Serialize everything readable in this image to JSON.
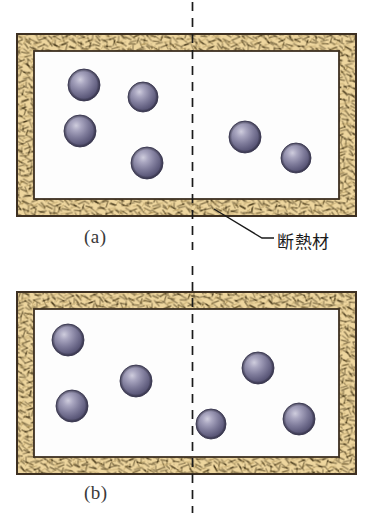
{
  "figure": {
    "background_color": "#ffffff",
    "captions": [
      {
        "id": "a",
        "text": "(a)",
        "x": 84,
        "y": 226
      },
      {
        "id": "b",
        "text": "(b)",
        "x": 84,
        "y": 482
      }
    ],
    "annotations": [
      {
        "name": "insulation-label",
        "text": "断熱材",
        "x": 277,
        "y": 228,
        "leader_line": {
          "x1": 214,
          "y1": 210,
          "x2": 268,
          "y2": 238
        }
      }
    ],
    "colors": {
      "insulation_fill": "#ecd49a",
      "insulation_fiber": "#4a3b1e",
      "insulation_fiber_light": "#b49a5c",
      "outline": "#3d3022",
      "interior_fill": "#fdfdfd",
      "sphere_core": "#6b6784",
      "sphere_highlight": "#b9b7cb",
      "sphere_edge": "#45435c",
      "sphere_outline": "#3b3950",
      "center_line": "#1a1a1a",
      "caption_text": "#3a3a3a",
      "annotation_text": "#1a1a1a"
    },
    "center_line": {
      "name": "symmetry-axis",
      "x": 192.5,
      "dash": "9,7",
      "segments": [
        {
          "y1": 2,
          "y2": 250
        },
        {
          "y1": 266,
          "y2": 513
        }
      ]
    },
    "panels": [
      {
        "id": "a",
        "name": "panel-a",
        "outer": {
          "x": 17,
          "y": 34,
          "w": 339,
          "h": 182
        },
        "insulation_thickness": 17,
        "inner": {
          "x": 34,
          "y": 51,
          "w": 305,
          "h": 148
        },
        "particles": [
          {
            "cx": 84,
            "cy": 85,
            "r": 16
          },
          {
            "cx": 143,
            "cy": 97,
            "r": 15
          },
          {
            "cx": 80,
            "cy": 131,
            "r": 16
          },
          {
            "cx": 147,
            "cy": 163,
            "r": 16
          },
          {
            "cx": 245,
            "cy": 137,
            "r": 16
          },
          {
            "cx": 296,
            "cy": 158,
            "r": 15
          }
        ],
        "particle_count_left": 4,
        "particle_count_right": 2
      },
      {
        "id": "b",
        "name": "panel-b",
        "outer": {
          "x": 17,
          "y": 292,
          "w": 339,
          "h": 182
        },
        "insulation_thickness": 17,
        "inner": {
          "x": 34,
          "y": 309,
          "w": 305,
          "h": 148
        },
        "particles": [
          {
            "cx": 68,
            "cy": 340,
            "r": 16
          },
          {
            "cx": 136,
            "cy": 381,
            "r": 16
          },
          {
            "cx": 72,
            "cy": 406,
            "r": 16
          },
          {
            "cx": 258,
            "cy": 368,
            "r": 16
          },
          {
            "cx": 211,
            "cy": 424,
            "r": 15
          },
          {
            "cx": 299,
            "cy": 419,
            "r": 16
          }
        ],
        "particle_count_left": 3,
        "particle_count_right": 3
      }
    ]
  }
}
